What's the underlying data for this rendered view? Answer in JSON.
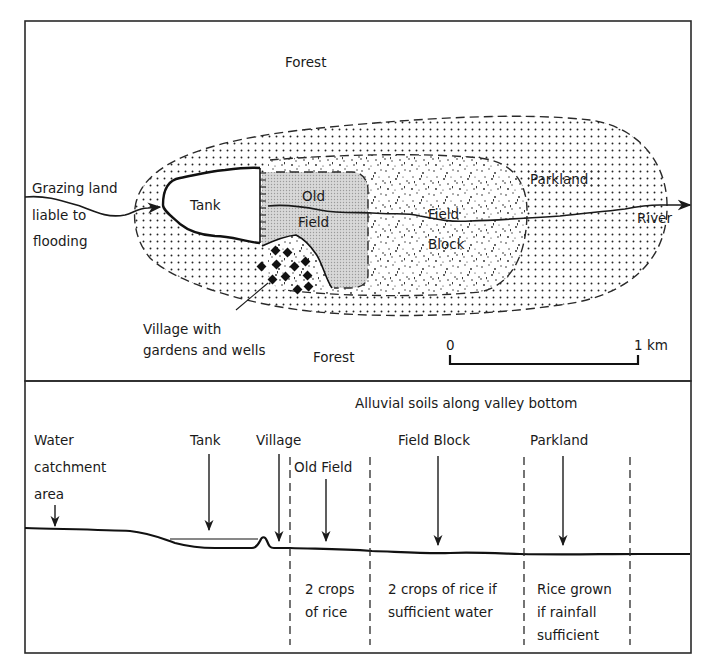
{
  "map": {
    "labels": {
      "forest_top": "Forest",
      "forest_bottom": "Forest",
      "grazing_line1": "Grazing land",
      "grazing_line2": "liable to",
      "grazing_line3": "flooding",
      "tank": "Tank",
      "old_field_line1": "Old",
      "old_field_line2": "Field",
      "field_block_line1": "Field",
      "field_block_line2": "Block",
      "parkland": "Parkland",
      "river": "River",
      "village_line1": "Village with",
      "village_line2": "gardens and wells"
    },
    "scale_bar": {
      "start_label": "0",
      "end_label": "1 km"
    },
    "patterns": {
      "parkland_fill": "coarse-dots",
      "field_block_fill": "random-stipple",
      "old_field_fill": "fine-grey-screen",
      "tank_fill": "white"
    },
    "village_markers": 11
  },
  "profile": {
    "title": "Alluvial soils along valley bottom",
    "labels": {
      "water_line1": "Water",
      "water_line2": "catchment",
      "water_line3": "area",
      "tank": "Tank",
      "village": "Village",
      "old_field": "Old Field",
      "field_block": "Field Block",
      "parkland": "Parkland"
    },
    "zones": [
      {
        "name": "Old Field",
        "line1": "2 crops",
        "line2": "of rice",
        "line3": ""
      },
      {
        "name": "Field Block",
        "line1": "2 crops of rice if",
        "line2": "sufficient water",
        "line3": ""
      },
      {
        "name": "Parkland",
        "line1": "Rice grown",
        "line2": "if rainfall",
        "line3": "sufficient"
      }
    ]
  },
  "colors": {
    "ink": "#1a1a1a",
    "paper": "#ffffff",
    "old_field_grey": "#cfcfcf"
  }
}
